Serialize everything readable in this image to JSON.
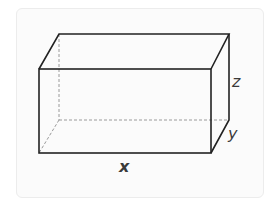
{
  "diagram": {
    "labels": {
      "x": "x",
      "y": "y",
      "z": "z"
    },
    "colors": {
      "edge": "#222222",
      "hidden_edge": "#9a9a9a",
      "card_background": "#fbfbfb",
      "card_border": "#ececec"
    },
    "vertices": {
      "front_top_left": [
        39,
        69
      ],
      "front_top_right": [
        211,
        69
      ],
      "front_bottom_left": [
        39,
        153
      ],
      "front_bottom_right": [
        211,
        153
      ],
      "back_top_left": [
        59,
        34
      ],
      "back_top_right": [
        229,
        34
      ],
      "back_bottom_left": [
        59,
        120
      ],
      "back_bottom_right": [
        229,
        120
      ]
    }
  }
}
